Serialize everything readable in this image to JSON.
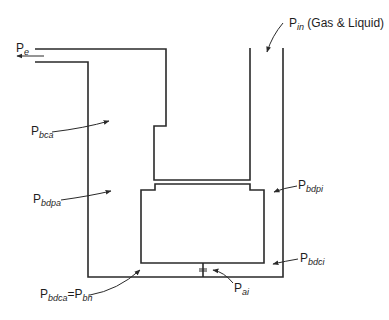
{
  "diagram": {
    "type": "gas-liquid separator pressure schematic",
    "labels": {
      "p_e": {
        "main": "P",
        "sub": "e",
        "rest": ""
      },
      "p_in": {
        "main": "P",
        "sub": "in",
        "rest": " (Gas & Liquid)"
      },
      "p_bca": {
        "main": "P",
        "sub": "bca",
        "rest": ""
      },
      "p_bdpa": {
        "main": "P",
        "sub": "bdpa",
        "rest": ""
      },
      "p_bdpi": {
        "main": "P",
        "sub": "bdpi",
        "rest": ""
      },
      "p_bdci": {
        "main": "P",
        "sub": "bdci",
        "rest": ""
      },
      "p_ai": {
        "main": "P",
        "sub": "ai",
        "rest": ""
      },
      "p_bdca": {
        "main": "P",
        "sub": "bdca",
        "eq": "=P",
        "sub2": "bh"
      }
    },
    "line_color": "#2a2a2a"
  }
}
